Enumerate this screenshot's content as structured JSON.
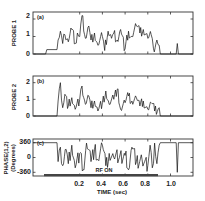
{
  "figure": {
    "panels": [
      {
        "tag": "(a)",
        "ylabel": "PROBE 1",
        "yticks": [
          "2",
          "1",
          "0"
        ]
      },
      {
        "tag": "(b)",
        "ylabel": "PROBE 2",
        "yticks": [
          "2",
          "1",
          "0"
        ]
      },
      {
        "tag": "(c)",
        "ylabel_line1": "PHASE(1,2)",
        "ylabel_line2": "(Degrees)",
        "yticks": [
          "360",
          "0",
          "-360"
        ],
        "annotation": "RF ON"
      }
    ],
    "xaxis": {
      "title": "TIME (sec)",
      "ticks": [
        "0.2",
        "0.4",
        "0.6",
        "0.8",
        "1.0"
      ]
    }
  },
  "chart_data": [
    {
      "type": "line",
      "title": "(a)",
      "xlabel": "TIME (sec)",
      "ylabel": "PROBE 1",
      "xlim": [
        -0.22,
        1.22
      ],
      "ylim": [
        0,
        2.4
      ],
      "grid": false,
      "x": [
        -0.2,
        -0.1,
        -0.09,
        0.0,
        0.01,
        0.03,
        0.05,
        0.07,
        0.1,
        0.13,
        0.16,
        0.18,
        0.2,
        0.22,
        0.25,
        0.28,
        0.3,
        0.33,
        0.36,
        0.4,
        0.42,
        0.45,
        0.48,
        0.5,
        0.53,
        0.56,
        0.6,
        0.63,
        0.66,
        0.7,
        0.73,
        0.76,
        0.8,
        0.83,
        0.85,
        0.88,
        0.9,
        0.91,
        1.0,
        1.05,
        1.06,
        1.07,
        1.2
      ],
      "values": [
        0.0,
        0.0,
        0.25,
        0.25,
        0.8,
        1.3,
        0.6,
        1.1,
        0.7,
        1.4,
        0.6,
        1.2,
        1.0,
        2.2,
        0.9,
        1.6,
        0.8,
        1.2,
        0.5,
        1.0,
        0.2,
        1.3,
        0.9,
        1.2,
        0.8,
        1.4,
        0.3,
        1.3,
        1.0,
        1.6,
        1.2,
        1.4,
        0.9,
        1.1,
        0.3,
        0.8,
        0.5,
        0.0,
        0.0,
        0.0,
        0.6,
        0.0,
        0.0
      ]
    },
    {
      "type": "line",
      "title": "(b)",
      "xlabel": "TIME (sec)",
      "ylabel": "PROBE 2",
      "xlim": [
        -0.22,
        1.22
      ],
      "ylim": [
        0,
        2.4
      ],
      "grid": false,
      "x": [
        -0.2,
        0.0,
        0.01,
        0.03,
        0.05,
        0.07,
        0.1,
        0.13,
        0.16,
        0.2,
        0.22,
        0.25,
        0.28,
        0.3,
        0.33,
        0.36,
        0.4,
        0.43,
        0.46,
        0.5,
        0.53,
        0.56,
        0.6,
        0.63,
        0.66,
        0.7,
        0.73,
        0.76,
        0.8,
        0.83,
        0.86,
        0.9,
        0.91,
        1.2
      ],
      "values": [
        0.0,
        0.0,
        0.9,
        2.0,
        0.5,
        1.3,
        0.6,
        1.1,
        0.4,
        1.0,
        1.8,
        0.7,
        1.2,
        0.5,
        0.9,
        0.3,
        0.8,
        1.5,
        0.7,
        1.0,
        1.6,
        0.4,
        0.8,
        1.2,
        0.9,
        1.1,
        0.6,
        0.9,
        0.4,
        0.8,
        0.3,
        0.5,
        0.0,
        0.0
      ]
    },
    {
      "type": "line",
      "title": "(c)",
      "xlabel": "TIME (sec)",
      "ylabel": "PHASE(1,2) (Degrees)",
      "xlim": [
        -0.22,
        1.22
      ],
      "ylim": [
        -450,
        450
      ],
      "grid": false,
      "x": [
        -0.22,
        0.0,
        0.01,
        0.03,
        0.05,
        0.08,
        0.1,
        0.13,
        0.16,
        0.2,
        0.23,
        0.26,
        0.3,
        0.33,
        0.36,
        0.4,
        0.43,
        0.46,
        0.5,
        0.55,
        0.6,
        0.63,
        0.66,
        0.7,
        0.75,
        0.8,
        0.82,
        0.84,
        0.86,
        0.88,
        0.9,
        0.91,
        1.05,
        1.06,
        1.07,
        1.22
      ],
      "values": [
        360,
        360,
        -100,
        250,
        -200,
        200,
        -150,
        300,
        -250,
        100,
        -300,
        350,
        -100,
        200,
        -50,
        300,
        -200,
        100,
        0,
        0,
        50,
        -300,
        250,
        -100,
        -50,
        -200,
        300,
        -250,
        350,
        -150,
        300,
        360,
        360,
        -360,
        360,
        360
      ],
      "annotations": [
        {
          "text": "RF ON",
          "x_start": -0.12,
          "x_end": 0.91,
          "y": -460
        }
      ]
    }
  ]
}
